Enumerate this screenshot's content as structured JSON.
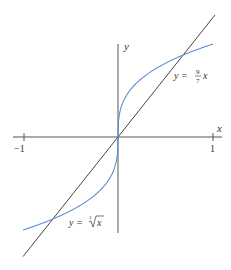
{
  "chart_data": {
    "type": "line",
    "title": "",
    "xlabel": "x",
    "ylabel": "y",
    "xlim": [
      -1.1,
      1.1
    ],
    "ylim": [
      -1.33,
      1.0
    ],
    "x_ticks": [
      -1,
      1
    ],
    "x_tick_labels": [
      "−1",
      "1"
    ],
    "grid": false,
    "legend": null,
    "series": [
      {
        "name": "y = ∛x",
        "function": "cbrt(x)",
        "color": "#5b8fd0",
        "x": [
          -1,
          -0.8,
          -0.686,
          -0.5,
          -0.3,
          -0.1,
          -0.01,
          0,
          0.01,
          0.1,
          0.3,
          0.5,
          0.686,
          0.8,
          1
        ],
        "values": [
          -1,
          -0.928,
          -0.882,
          -0.794,
          -0.669,
          -0.464,
          -0.215,
          0,
          0.215,
          0.464,
          0.669,
          0.794,
          0.882,
          0.928,
          1
        ]
      },
      {
        "name": "y = 9/7 x",
        "function": "9/7*x",
        "color": "#444444",
        "x": [
          -1,
          0,
          1.02
        ],
        "values": [
          -1.286,
          0,
          1.311
        ]
      }
    ],
    "annotations": [
      {
        "text": "y = 9/7 x",
        "x": 0.72,
        "y": 0.6
      },
      {
        "text": "y = ∛x",
        "x": -0.5,
        "y": -1.1
      }
    ],
    "intersections": [
      {
        "x": -0.686,
        "y": -0.882
      },
      {
        "x": 0,
        "y": 0
      },
      {
        "x": 0.686,
        "y": 0.882
      }
    ]
  },
  "labels": {
    "x_axis": "x",
    "y_axis": "y",
    "tick_neg1": "−1",
    "tick_pos1": "1",
    "line_label_prefix": "y =",
    "line_label_num": "9",
    "line_label_den": "7",
    "line_label_var": "x",
    "curve_label_prefix": "y =",
    "curve_label_index": "3",
    "curve_label_var": "x"
  }
}
